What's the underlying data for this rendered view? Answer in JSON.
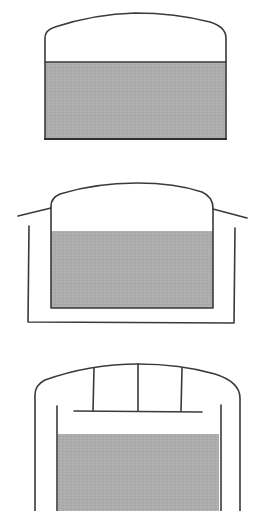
{
  "diagram": {
    "title": "",
    "colors": {
      "background": "#ffffff",
      "outline": "#333333",
      "liquid": "#ababab"
    },
    "tanks": [
      {
        "id": "tank-1",
        "type": "single-wall domed tank",
        "components": [
          "dome-roof",
          "tank-wall",
          "liquid-fill",
          "liquid-surface-line"
        ]
      },
      {
        "id": "tank-2",
        "type": "domed tank inside open outer containment with sloped roof extensions",
        "components": [
          "dome-roof",
          "inner-tank-wall",
          "liquid-fill",
          "roof-extension-left",
          "roof-extension-right",
          "outer-containment-wall"
        ]
      },
      {
        "id": "tank-3",
        "type": "double-wall tank with suspended deck on struts under dome",
        "components": [
          "outer-dome-wall",
          "suspended-deck",
          "deck-strut-left",
          "deck-strut-center",
          "deck-strut-right",
          "inner-tank-wall",
          "liquid-fill"
        ]
      }
    ]
  }
}
